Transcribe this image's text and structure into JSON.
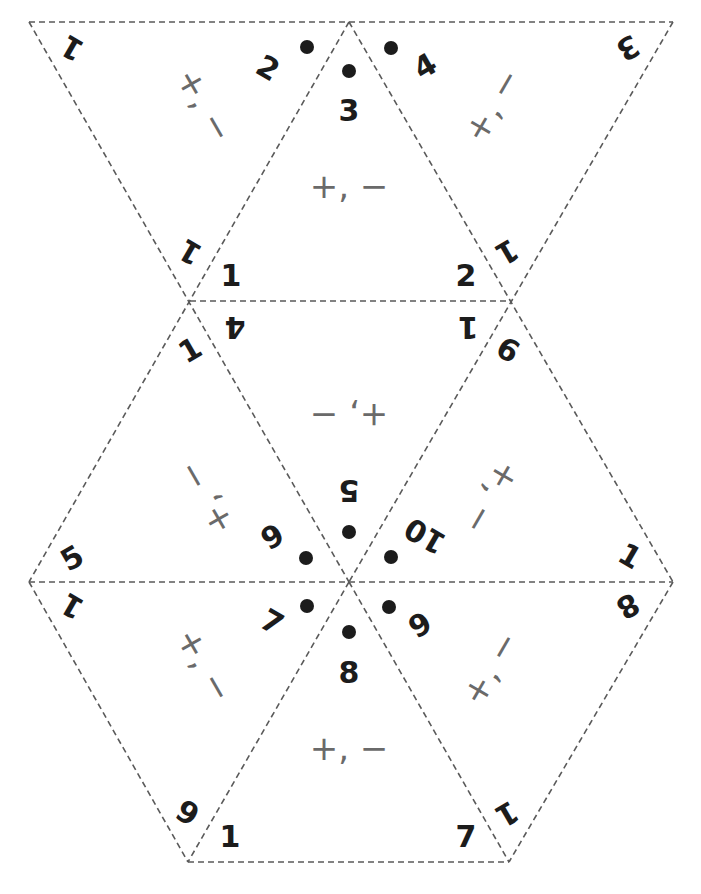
{
  "diagram": {
    "type": "flexagon-net",
    "edge_color": "#5a5a5a",
    "text_color": "#1c1c1c",
    "ops_color": "#6a6a6a",
    "operations_label": "+, −",
    "triangles": [
      {
        "id": "t1",
        "labels": [
          "1",
          "2",
          "1"
        ]
      },
      {
        "id": "t2",
        "labels": [
          "3",
          "1",
          "2"
        ]
      },
      {
        "id": "t3",
        "labels": [
          "4",
          "3",
          "1"
        ]
      },
      {
        "id": "t4",
        "labels": [
          "4",
          "1",
          "5"
        ]
      },
      {
        "id": "t5",
        "labels": [
          "1",
          "5",
          "6"
        ]
      },
      {
        "id": "t6",
        "labels": [
          "6",
          "10",
          "1"
        ]
      },
      {
        "id": "t7",
        "labels": [
          "1",
          "7",
          "6"
        ]
      },
      {
        "id": "t8",
        "labels": [
          "8",
          "1",
          "7"
        ]
      },
      {
        "id": "t9",
        "labels": [
          "9",
          "8",
          "1"
        ]
      }
    ]
  }
}
